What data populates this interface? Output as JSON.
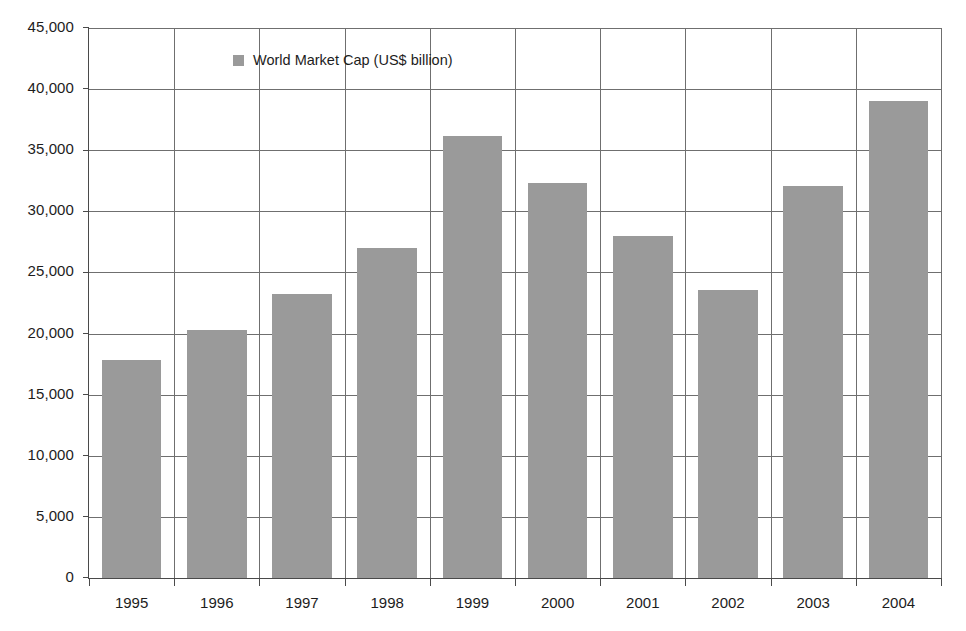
{
  "chart_data": {
    "type": "bar",
    "title": "",
    "xlabel": "",
    "ylabel": "",
    "categories": [
      "1995",
      "1996",
      "1997",
      "1998",
      "1999",
      "2000",
      "2001",
      "2002",
      "2003",
      "2004"
    ],
    "values": [
      17800,
      20300,
      23200,
      27000,
      36200,
      32300,
      28000,
      23600,
      32100,
      39000
    ],
    "series": [
      {
        "name": "World Market Cap (US$ billion)",
        "values": [
          17800,
          20300,
          23200,
          27000,
          36200,
          32300,
          28000,
          23600,
          32100,
          39000
        ],
        "color": "#9a9a9a"
      }
    ],
    "ylim": [
      0,
      45000
    ],
    "ytick_labels": [
      "45,000",
      "40,000",
      "35,000",
      "30,000",
      "25,000",
      "20,000",
      "15,000",
      "10,000",
      "5,000",
      "0"
    ],
    "ytick_values": [
      45000,
      40000,
      35000,
      30000,
      25000,
      20000,
      15000,
      10000,
      5000,
      0
    ],
    "grid": "both",
    "legend_position": "inside-top-left",
    "legend_entries": [
      {
        "label": "World Market Cap (US$ billion)",
        "marker": "square",
        "color": "#9a9a9a"
      }
    ],
    "colors": {
      "bar": "#9a9a9a",
      "axis": "#4a4a4a",
      "grid": "#6f6f6f",
      "text": "#1d1d1d",
      "background": "#ffffff"
    }
  }
}
